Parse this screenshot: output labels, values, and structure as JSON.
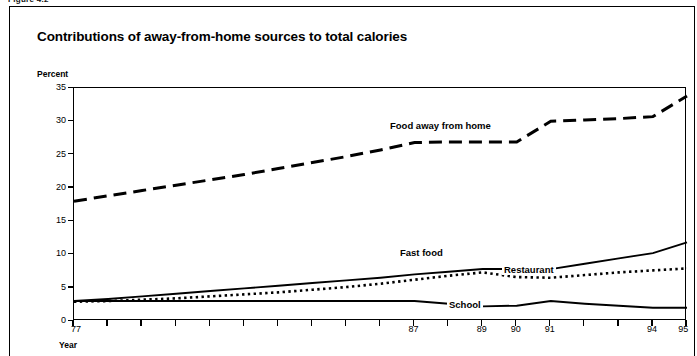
{
  "figure_header": "Figure 4.2",
  "chart_title": "Contributions of away-from-home sources to total calories",
  "axis": {
    "y_title": "Percent",
    "x_title": "Year",
    "y_ticks": [
      "0",
      "5",
      "10",
      "15",
      "20",
      "25",
      "30",
      "35"
    ],
    "x_ticks": [
      "77",
      "87",
      "89",
      "90",
      "91",
      "94",
      "95"
    ]
  },
  "series_labels": {
    "food_away": "Food away from home",
    "fast_food": "Fast food",
    "restaurant": "Restaurant",
    "school": "School"
  },
  "colors": {
    "line": "#000000",
    "background": "#ffffff",
    "border": "#000000"
  },
  "chart_data": {
    "type": "line",
    "title": "Contributions of away-from-home sources to total calories",
    "xlabel": "Year",
    "ylabel": "Percent",
    "xlim": [
      77,
      95
    ],
    "ylim": [
      0,
      35
    ],
    "grid": false,
    "legend": "inline-labels",
    "x": [
      77,
      78,
      79,
      80,
      81,
      82,
      83,
      84,
      85,
      86,
      87,
      88,
      89,
      90,
      91,
      92,
      93,
      94,
      95
    ],
    "series": [
      {
        "name": "Food away from home",
        "style": "long-dashed",
        "values": [
          18.0,
          18.8,
          19.6,
          20.4,
          21.2,
          22.0,
          22.9,
          23.8,
          24.7,
          25.7,
          26.8,
          26.9,
          26.9,
          26.9,
          30.0,
          30.2,
          30.4,
          30.7,
          33.8
        ]
      },
      {
        "name": "Fast food",
        "style": "solid",
        "values": [
          3.0,
          3.3,
          3.7,
          4.1,
          4.5,
          4.9,
          5.3,
          5.7,
          6.1,
          6.5,
          7.0,
          7.4,
          7.8,
          7.8,
          7.8,
          8.6,
          9.4,
          10.2,
          11.8
        ]
      },
      {
        "name": "Restaurant",
        "style": "dotted",
        "values": [
          2.9,
          3.0,
          3.2,
          3.4,
          3.7,
          4.0,
          4.3,
          4.7,
          5.1,
          5.6,
          6.2,
          6.8,
          7.3,
          6.6,
          6.5,
          6.9,
          7.3,
          7.6,
          7.9
        ]
      },
      {
        "name": "School",
        "style": "solid",
        "values": [
          3.0,
          3.0,
          3.0,
          3.0,
          3.0,
          3.0,
          3.0,
          3.0,
          3.0,
          3.0,
          3.0,
          2.6,
          2.2,
          2.3,
          3.0,
          2.6,
          2.3,
          2.0,
          2.0
        ]
      }
    ]
  }
}
